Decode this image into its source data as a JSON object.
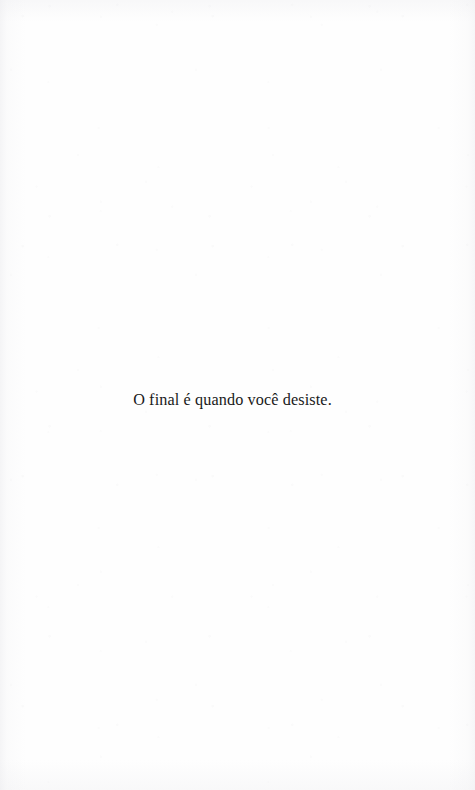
{
  "page": {
    "kind": "scanned-book-page",
    "width": 475,
    "height": 790,
    "background_color": "#fefefe",
    "text_color": "#1a1a1a"
  },
  "content": {
    "line": "O final é quando você desiste."
  }
}
